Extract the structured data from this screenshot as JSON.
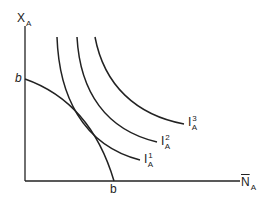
{
  "diagram": {
    "type": "indifference-curve-diagram",
    "axes": {
      "y": {
        "symbol": "X",
        "subscript": "A"
      },
      "x": {
        "symbol": "N",
        "overbar": true,
        "subscript": "A"
      }
    },
    "intercepts": {
      "y_label": "b",
      "x_label": "b"
    },
    "curves": [
      {
        "id": "budget",
        "description": "concave production/constraint curve from b on y-axis to b on x-axis"
      },
      {
        "id": "I1",
        "symbol": "I",
        "superscript": "1",
        "subscript": "A"
      },
      {
        "id": "I2",
        "symbol": "I",
        "superscript": "2",
        "subscript": "A"
      },
      {
        "id": "I3",
        "symbol": "I",
        "superscript": "3",
        "subscript": "A"
      }
    ],
    "colors": {
      "line": "#222222",
      "background": "#ffffff"
    }
  }
}
